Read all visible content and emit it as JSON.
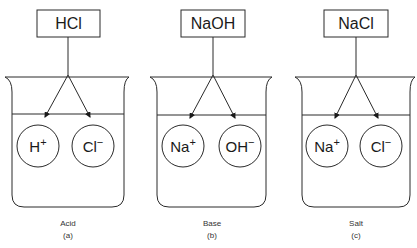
{
  "diagram": {
    "line_color": "#2a2a2a",
    "panels": [
      {
        "id": "a",
        "compound": "HCl",
        "ions": [
          {
            "base": "H",
            "charge": "+"
          },
          {
            "base": "Cl",
            "charge": "−"
          }
        ],
        "caption": "Acid",
        "label": "(a)"
      },
      {
        "id": "b",
        "compound": "NaOH",
        "ions": [
          {
            "base": "Na",
            "charge": "+"
          },
          {
            "base": "OH",
            "charge": "−"
          }
        ],
        "caption": "Base",
        "label": "(b)"
      },
      {
        "id": "c",
        "compound": "NaCl",
        "ions": [
          {
            "base": "Na",
            "charge": "+"
          },
          {
            "base": "Cl",
            "charge": "−"
          }
        ],
        "caption": "Salt",
        "label": "(c)"
      }
    ]
  }
}
